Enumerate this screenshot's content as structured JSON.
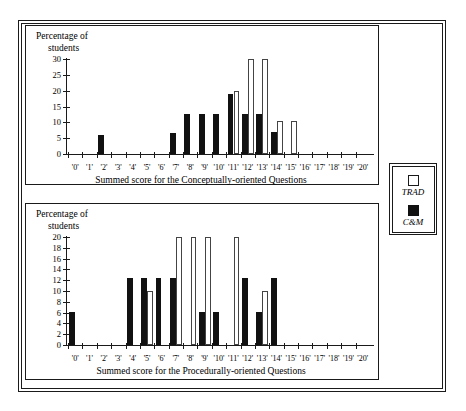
{
  "figure": {
    "background_color": "#ffffff",
    "ink_color": "#1a1a1a"
  },
  "legend": {
    "name": "series-legend",
    "entries": [
      {
        "label": "TRAD",
        "style": "open",
        "color": "#ffffff",
        "border": "#1a1a1a"
      },
      {
        "label": "C&M",
        "style": "filled",
        "color": "#111111",
        "border": "#111111"
      }
    ]
  },
  "chart_data": [
    {
      "id": "conceptually-oriented",
      "type": "bar",
      "title": "",
      "xlabel": "Summed score for the Conceptually-oriented Questions",
      "ylabel": "Percentage of students",
      "ylabel_line1": "Percentage of",
      "ylabel_line2": "students",
      "grid": false,
      "legend_position": "right-outside",
      "ylim": [
        0,
        30
      ],
      "yticks": [
        0,
        5,
        10,
        15,
        20,
        25,
        30
      ],
      "categories": [
        "'0'",
        "'1'",
        "'2'",
        "'3'",
        "'4'",
        "'5'",
        "'6'",
        "'7'",
        "'8'",
        "'9'",
        "'10'",
        "'11'",
        "'12'",
        "'13'",
        "'14'",
        "'15'",
        "'16'",
        "'17'",
        "'18'",
        "'19'",
        "'20'"
      ],
      "series": [
        {
          "name": "TRAD",
          "style": "open",
          "values": [
            0,
            0,
            0,
            0,
            0,
            0,
            0,
            0,
            0,
            0,
            0,
            20,
            30,
            30,
            10.5,
            10.5,
            0,
            0,
            0,
            0,
            0
          ]
        },
        {
          "name": "C&M",
          "style": "filled",
          "values": [
            0,
            0,
            6,
            0,
            0,
            0,
            0,
            6.5,
            12.5,
            12.5,
            12.5,
            19,
            12.5,
            12.5,
            7,
            0,
            0,
            0,
            0,
            0,
            0
          ]
        }
      ]
    },
    {
      "id": "procedurally-oriented",
      "type": "bar",
      "title": "",
      "xlabel": "Summed score for the Procedurally-oriented Questions",
      "ylabel": "Percentage of students",
      "ylabel_line1": "Percentage of",
      "ylabel_line2": "students",
      "grid": false,
      "legend_position": "right-outside",
      "ylim": [
        0,
        20
      ],
      "yticks": [
        0,
        2,
        4,
        6,
        8,
        10,
        12,
        14,
        16,
        18,
        20
      ],
      "categories": [
        "'0'",
        "'1'",
        "'2'",
        "'3'",
        "'4'",
        "'5'",
        "'6'",
        "'7'",
        "'8'",
        "'9'",
        "'10'",
        "'11'",
        "'12'",
        "'13'",
        "'14'",
        "'15'",
        "'16'",
        "'17'",
        "'18'",
        "'19'",
        "'20'"
      ],
      "series": [
        {
          "name": "TRAD",
          "style": "open",
          "values": [
            0,
            0,
            0,
            0,
            0,
            10,
            0,
            20,
            20,
            20,
            0,
            20,
            0,
            10,
            0,
            0,
            0,
            0,
            0,
            0,
            0
          ]
        },
        {
          "name": "C&M",
          "style": "filled",
          "values": [
            6.2,
            0,
            0,
            0,
            12.5,
            12.5,
            12.5,
            12.5,
            0,
            6.2,
            6.2,
            0,
            12.5,
            6.2,
            12.5,
            0,
            0,
            0,
            0,
            0,
            0
          ]
        }
      ]
    }
  ]
}
